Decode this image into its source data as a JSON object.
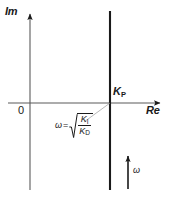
{
  "figure": {
    "background_color": "#ffffff",
    "line_color": "#1a1a1a",
    "axis_color": "#555555",
    "width": 171,
    "height": 201
  },
  "axes": {
    "imaginary_label": "Im",
    "real_label": "Re",
    "origin_label": "0",
    "origin_px": {
      "x": 30,
      "y": 103
    },
    "imaginary_axis": {
      "x": 30,
      "y_top": 8,
      "y_bottom": 190
    },
    "real_axis": {
      "y": 103,
      "x_left": 8,
      "x_right": 166
    }
  },
  "locus": {
    "label": "Kp",
    "label_main": "K",
    "label_sub": "P",
    "x_px": 110,
    "y_top": 11,
    "y_bottom": 190,
    "description": "vertical line at Re = Kp"
  },
  "equation": {
    "omega_symbol": "ω",
    "equals": "=",
    "radical_numerator_main": "K",
    "radical_numerator_sub": "I",
    "radical_denominator_main": "K",
    "radical_denominator_sub": "D",
    "plain_text": "ω = √(K_I / K_D)"
  },
  "direction_arrow": {
    "label": "ω",
    "x_px": 128,
    "y_tail": 189,
    "y_head": 150,
    "direction": "up"
  }
}
